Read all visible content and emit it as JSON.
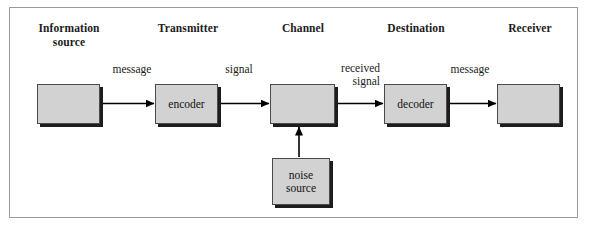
{
  "diagram": {
    "frame": {
      "border_color": "#9a9a9a"
    },
    "headers": [
      {
        "name": "information-source",
        "label": "Information\nsource"
      },
      {
        "name": "transmitter",
        "label": "Transmitter"
      },
      {
        "name": "channel",
        "label": "Channel"
      },
      {
        "name": "destination",
        "label": "Destination"
      },
      {
        "name": "receiver",
        "label": "Receiver"
      }
    ],
    "nodes": [
      {
        "name": "information-source-box",
        "label": ""
      },
      {
        "name": "encoder-box",
        "label": "encoder"
      },
      {
        "name": "channel-box",
        "label": ""
      },
      {
        "name": "decoder-box",
        "label": "decoder"
      },
      {
        "name": "receiver-box",
        "label": ""
      },
      {
        "name": "noise-source-box",
        "label": "noise\nsource"
      }
    ],
    "edge_labels": [
      {
        "name": "edge-label-message-1",
        "label": "message"
      },
      {
        "name": "edge-label-signal",
        "label": "signal"
      },
      {
        "name": "edge-label-received-signal",
        "label": "received\nsignal"
      },
      {
        "name": "edge-label-message-2",
        "label": "message"
      }
    ],
    "colors": {
      "box_fill": "#d2d2d2",
      "box_border": "#4a4a4a",
      "box_shadow": "#1d1d1d",
      "arrow": "#000000",
      "text": "#1b1b1b",
      "frame_border": "#9a9a9a",
      "background": "#ffffff"
    }
  }
}
